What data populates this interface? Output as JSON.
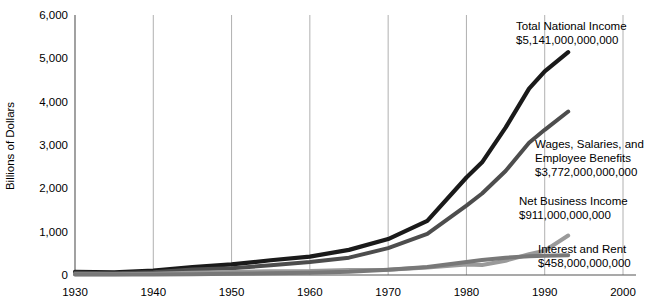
{
  "chart_data": {
    "type": "line",
    "title": "",
    "xlabel": "",
    "ylabel": "Billions of Dollars",
    "xlim": [
      1930,
      2000
    ],
    "ylim": [
      0,
      6000
    ],
    "grid": "vertical",
    "legend_position": "inline-right-annotations",
    "xticks": [
      "1930",
      "1940",
      "1950",
      "1960",
      "1970",
      "1980",
      "1990",
      "2000"
    ],
    "yticks": [
      "0",
      "1,000",
      "2,000",
      "3,000",
      "4,000",
      "5,000",
      "6,000"
    ],
    "x": [
      1930,
      1935,
      1940,
      1945,
      1950,
      1955,
      1960,
      1965,
      1970,
      1975,
      1980,
      1982,
      1985,
      1988,
      1990,
      1993
    ],
    "series": [
      {
        "name": "Total National Income",
        "value_label": "$5,141,000,000,000",
        "color": "#1a1a1a",
        "width": 4.2,
        "values": [
          75,
          60,
          100,
          185,
          245,
          340,
          425,
          580,
          830,
          1250,
          2250,
          2600,
          3400,
          4300,
          4700,
          5141
        ]
      },
      {
        "name": "Wages, Salaries, and Employee Benefits",
        "value_label": "$3,772,000,000,000",
        "color": "#4d4d4d",
        "width": 4.0,
        "values": [
          50,
          40,
          65,
          125,
          155,
          225,
          300,
          400,
          620,
          950,
          1600,
          1880,
          2400,
          3050,
          3350,
          3772
        ]
      },
      {
        "name": "Net Business Income",
        "value_label": "$911,000,000,000",
        "color": "#9a9a9a",
        "width": 4.0,
        "values": [
          20,
          18,
          30,
          50,
          70,
          85,
          90,
          115,
          120,
          175,
          240,
          230,
          330,
          480,
          560,
          911
        ]
      },
      {
        "name": "Interest and Rent",
        "value_label": "$458,000,000,000",
        "color": "#787878",
        "width": 4.0,
        "values": [
          12,
          10,
          14,
          20,
          28,
          38,
          52,
          75,
          120,
          185,
          300,
          345,
          400,
          430,
          445,
          458
        ]
      }
    ]
  }
}
